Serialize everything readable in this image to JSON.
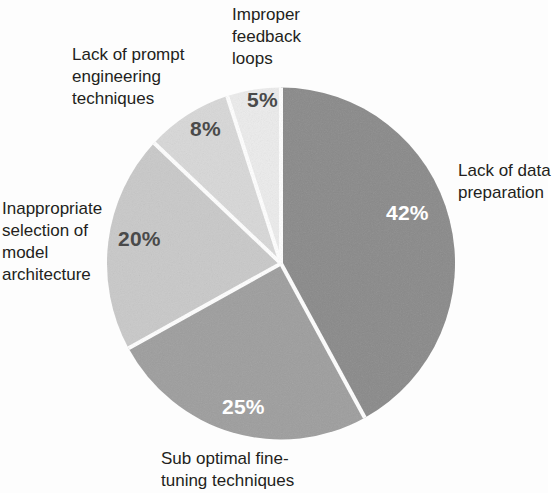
{
  "chart_data": {
    "type": "pie",
    "title": "",
    "subtitle": "",
    "xlabel": "",
    "ylabel": "",
    "legend_position": "callout-labels",
    "grid": false,
    "unit": "%",
    "total": 100,
    "start_angle_deg": 0,
    "direction": "clockwise",
    "categories": [
      "Lack of data preparation",
      "Sub optimal fine-tuning techniques",
      "Inappropriate selection of model architecture",
      "Lack of prompt engineering techniques",
      "Improper feedback loops"
    ],
    "values": [
      42,
      25,
      20,
      8,
      5
    ],
    "slices": [
      {
        "key": "data-prep",
        "label": "Lack of data preparation",
        "label_lines": "Lack of data\npreparation",
        "value": 42,
        "value_text": "42%",
        "color": "#8a8a8a",
        "value_color": "#ffffff",
        "value_tone": "light"
      },
      {
        "key": "fine-tuning",
        "label": "Sub optimal fine-tuning techniques",
        "label_lines": "Sub optimal fine-\ntuning techniques",
        "value": 25,
        "value_text": "25%",
        "color": "#9e9e9e",
        "value_color": "#ffffff",
        "value_tone": "light"
      },
      {
        "key": "model-arch",
        "label": "Inappropriate selection of model architecture",
        "label_lines": "Inappropriate\nselection of\nmodel\narchitecture",
        "value": 20,
        "value_text": "20%",
        "color": "#c9c9c9",
        "value_color": "#4a4a4a",
        "value_tone": "dark"
      },
      {
        "key": "prompt-eng",
        "label": "Lack of prompt engineering techniques",
        "label_lines": "Lack of prompt\nengineering\ntechniques",
        "value": 8,
        "value_text": "8%",
        "color": "#d8d8d8",
        "value_color": "#4a4a4a",
        "value_tone": "dark"
      },
      {
        "key": "feedback",
        "label": "Improper feedback loops",
        "label_lines": "Improper\nfeedback\nloops",
        "value": 5,
        "value_text": "5%",
        "color": "#ececec",
        "value_color": "#4a4a4a",
        "value_tone": "dark"
      }
    ],
    "separator_color": "#ffffff",
    "background_color": "#fdfdfd",
    "text_color": "#231f20"
  }
}
